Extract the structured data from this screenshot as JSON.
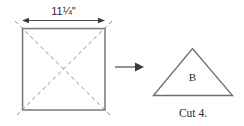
{
  "figure": {
    "background_color": "#ffffff",
    "line_color": "#6e6e70",
    "dark_line_color": "#3a3a3c",
    "text_color": "#2b2b2b",
    "dimension": {
      "label": "11¼\"",
      "icon": "double-headed-arrow-icon"
    },
    "square": {
      "name": "fabric-square",
      "fold_lines": "dashed-diagonals"
    },
    "flow": {
      "icon": "right-arrow-icon"
    },
    "triangle": {
      "label": "B"
    },
    "caption": "Cut 4."
  }
}
